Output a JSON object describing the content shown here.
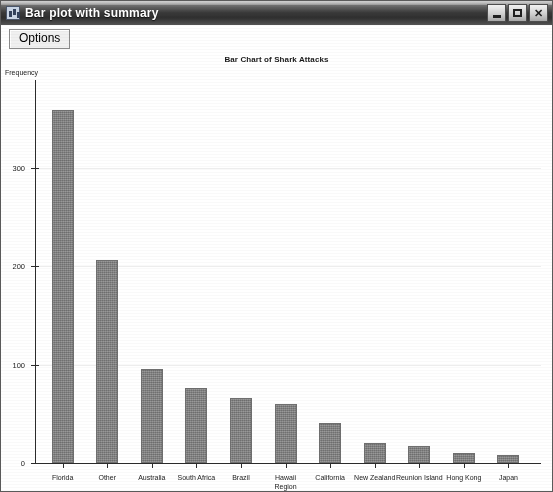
{
  "window": {
    "title": "Bar plot with summary",
    "icon": "app-icon",
    "controls": {
      "minimize": "minimize-icon",
      "maximize": "maximize-icon",
      "close": "✕"
    }
  },
  "toolbar": {
    "options_label": "Options"
  },
  "chart_data": {
    "type": "bar",
    "title": "Bar Chart of Shark Attacks",
    "xlabel": "",
    "ylabel": "Frequency",
    "ylim": [
      0,
      390
    ],
    "yticks": [
      0,
      100,
      200,
      300
    ],
    "ytick_labels": [
      "0",
      "100",
      "200",
      "300"
    ],
    "grid": true,
    "legend": "none",
    "categories": [
      "Florida",
      "Other",
      "Australia",
      "South Africa",
      "Brazil",
      "Hawaii\nRegion",
      "California",
      "New Zealand",
      "Reunion Island",
      "Hong Kong",
      "Japan"
    ],
    "values": [
      359,
      206,
      95,
      76,
      66,
      60,
      41,
      20,
      17,
      10,
      8
    ],
    "bar_color": "#848484"
  }
}
